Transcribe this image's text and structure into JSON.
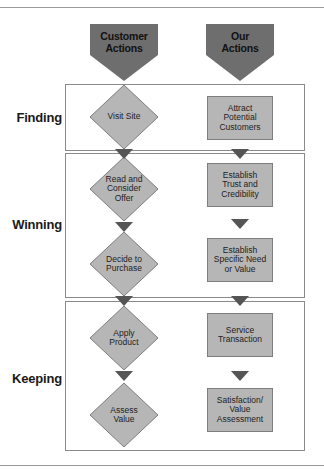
{
  "columns": {
    "customer": {
      "label_line1": "Customer",
      "label_line2": "Actions"
    },
    "ours": {
      "label_line1": "Our",
      "label_line2": "Actions"
    }
  },
  "stages": [
    {
      "label": "Finding",
      "customer_steps": [
        {
          "lines": [
            "Visit Site"
          ]
        }
      ],
      "our_steps": [
        {
          "lines": [
            "Attract",
            "Potential",
            "Customers"
          ]
        }
      ]
    },
    {
      "label": "Winning",
      "customer_steps": [
        {
          "lines": [
            "Read and",
            "Consider",
            "Offer"
          ]
        },
        {
          "lines": [
            "Decide to",
            "Purchase"
          ]
        }
      ],
      "our_steps": [
        {
          "lines": [
            "Establish",
            "Trust and",
            "Credibility"
          ]
        },
        {
          "lines": [
            "Establish",
            "Specific Need",
            "or Value"
          ]
        }
      ]
    },
    {
      "label": "Keeping",
      "customer_steps": [
        {
          "lines": [
            "Apply",
            "Product"
          ]
        },
        {
          "lines": [
            "Assess",
            "Value"
          ]
        }
      ],
      "our_steps": [
        {
          "lines": [
            "Service",
            "Transaction"
          ]
        },
        {
          "lines": [
            "Satisfaction/",
            "Value",
            "Assessment"
          ]
        }
      ]
    }
  ],
  "colors": {
    "header_fill": "#6e6e6e",
    "shape_fill": "#b6b6b6",
    "arrow_fill": "#555555",
    "border": "#8a8a8a"
  }
}
